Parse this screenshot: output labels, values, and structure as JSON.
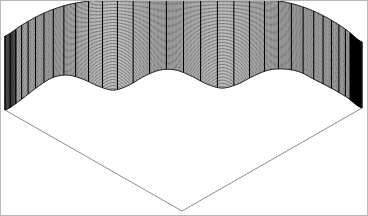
{
  "figure": {
    "width": 368,
    "height": 216,
    "background_color": "#ffffff",
    "border_color": "#b9b9b9",
    "title": "",
    "axes_visible": false,
    "tick_labels_visible": false,
    "legend_visible": false
  },
  "plot": {
    "name": "3d-mesh-surface",
    "render_style": "wireframe-mesh",
    "line_color": "#000000",
    "fill_color": "#ffffff",
    "base_outline_color": "#808080",
    "projection": "perspective-3d",
    "view_azimuth_deg": -37.5,
    "view_elevation_deg": 30
  },
  "chart_data": {
    "type": "surface",
    "title": "",
    "subtitle": "",
    "xlabel": "",
    "ylabel": "",
    "zlabel": "",
    "grid": false,
    "legend_position": "none",
    "description": "Radially undulating wireframe mesh surface drawn as a skirted curtain over a square domain shown in 3-D axonometric projection. The top rim is a smooth arc, the lower rim is scalloped with four repeating lobes.",
    "x": [
      -3.0,
      -2.75,
      -2.5,
      -2.25,
      -2.0,
      -1.75,
      -1.5,
      -1.25,
      -1.0,
      -0.75,
      -0.5,
      -0.25,
      0.0,
      0.25,
      0.5,
      0.75,
      1.0,
      1.25,
      1.5,
      1.75,
      2.0,
      2.25,
      2.5,
      2.75,
      3.0
    ],
    "y": [
      -3.0,
      -2.75,
      -2.5,
      -2.25,
      -2.0,
      -1.75,
      -1.5,
      -1.25,
      -1.0,
      -0.75,
      -0.5,
      -0.25,
      0.0,
      0.25,
      0.5,
      0.75,
      1.0,
      1.25,
      1.5,
      1.75,
      2.0,
      2.25,
      2.5,
      2.75,
      3.0
    ],
    "xlim": [
      -3.0,
      3.0
    ],
    "ylim": [
      -3.0,
      3.0
    ],
    "zlim": [
      0.0,
      1.0
    ],
    "n_mesh_columns": 33,
    "n_mesh_rows": 60,
    "lobe_count": 4,
    "rim_profile_top": [
      36,
      26,
      17,
      10,
      5,
      2,
      0,
      0,
      0,
      0,
      0,
      0,
      0,
      0,
      0,
      0,
      0,
      0,
      2,
      6,
      12,
      20,
      30,
      42
    ],
    "rim_profile_bottom": [
      110,
      100,
      88,
      78,
      75,
      79,
      86,
      90,
      85,
      76,
      70,
      70,
      76,
      84,
      88,
      84,
      76,
      70,
      69,
      72,
      80,
      88,
      97,
      108
    ],
    "baseline_vertices": [
      [
        5,
        110
      ],
      [
        182,
        211
      ],
      [
        362,
        108
      ]
    ]
  },
  "geometry": {
    "surface_left_corner": {
      "x": 5,
      "y": 110
    },
    "surface_right_corner": {
      "x": 362,
      "y": 108
    },
    "base_apex": {
      "x": 182,
      "y": 211
    },
    "dark_band_x_range": [
      350,
      361
    ],
    "light_band_x_range": [
      5,
      16
    ]
  },
  "annotations": []
}
